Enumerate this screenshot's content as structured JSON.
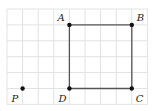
{
  "diagram": {
    "grid": {
      "origin": [
        7,
        9
      ],
      "cell": [
        15.6,
        15.9
      ],
      "cols": 9,
      "rows": 6,
      "line_color": "#e2e2e2"
    },
    "shape": {
      "type": "square",
      "stroke": "#555555",
      "vertices": [
        "A",
        "B",
        "C",
        "D"
      ]
    },
    "points": [
      {
        "name": "A",
        "label": "A",
        "gx": 4,
        "gy": 1,
        "lx": -12,
        "ly": -4
      },
      {
        "name": "B",
        "label": "B",
        "gx": 8,
        "gy": 1,
        "lx": 5,
        "ly": -4
      },
      {
        "name": "C",
        "label": "C",
        "gx": 8,
        "gy": 5,
        "lx": 4,
        "ly": 13
      },
      {
        "name": "D",
        "label": "D",
        "gx": 4,
        "gy": 5,
        "lx": -11,
        "ly": 13
      },
      {
        "name": "P",
        "label": "P",
        "gx": 1,
        "gy": 5,
        "lx": -11,
        "ly": 13
      }
    ]
  }
}
